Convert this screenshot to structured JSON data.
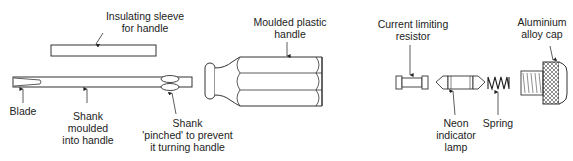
{
  "diagram": {
    "labels": {
      "insulating_sleeve": [
        "Insulating sleeve",
        "for handle"
      ],
      "blade": [
        "Blade"
      ],
      "shank_moulded": [
        "Shank",
        "moulded",
        "into handle"
      ],
      "shank_pinched": [
        "Shank",
        "'pinched' to prevent",
        "it turning handle"
      ],
      "moulded_handle": [
        "Moulded plastic",
        "handle"
      ],
      "resistor": [
        "Current limiting",
        "resistor"
      ],
      "neon_lamp": [
        "Neon",
        "indicator",
        "lamp"
      ],
      "spring": [
        "Spring"
      ],
      "cap": [
        "Aluminium",
        "alloy cap"
      ]
    },
    "components": [
      {
        "name": "insulating-sleeve",
        "label": "Insulating sleeve for handle"
      },
      {
        "name": "blade-shank",
        "label": "Blade / Shank"
      },
      {
        "name": "moulded-handle",
        "label": "Moulded plastic handle"
      },
      {
        "name": "current-limiting-resistor",
        "label": "Current limiting resistor"
      },
      {
        "name": "neon-indicator-lamp",
        "label": "Neon indicator lamp"
      },
      {
        "name": "spring",
        "label": "Spring"
      },
      {
        "name": "aluminium-alloy-cap",
        "label": "Aluminium alloy cap"
      }
    ],
    "colors": {
      "line": "#333333",
      "background": "#ffffff"
    }
  }
}
